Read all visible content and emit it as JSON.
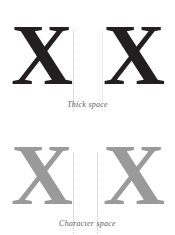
{
  "figure": {
    "background_color": "#ffffff",
    "guide_color": "#c9c9c9",
    "panels": [
      {
        "id": "thick-space",
        "caption": "Thick space",
        "glyph": "X",
        "glyph_color": "#231f20",
        "left_glyph": "X",
        "right_glyph": "X",
        "guides": [
          {
            "label": "left-glyph-right-edge",
            "x": 73
          },
          {
            "label": "right-glyph-left-edge",
            "x": 102
          }
        ]
      },
      {
        "id": "character-space",
        "caption": "Character space",
        "glyph": "X",
        "glyph_color": "#9a9a9a",
        "left_glyph": "X",
        "right_glyph": "X",
        "guides": [
          {
            "label": "left-glyph-right-edge",
            "x": 73
          },
          {
            "label": "right-glyph-left-edge",
            "x": 97
          }
        ]
      }
    ]
  }
}
